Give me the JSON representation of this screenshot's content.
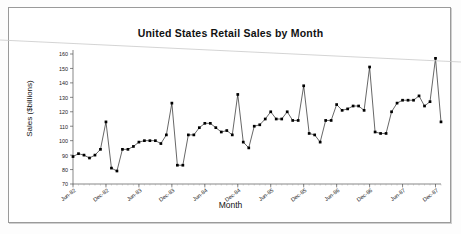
{
  "chart_data": {
    "type": "line",
    "title": "United States Retail Sales by Month",
    "xlabel": "Month",
    "ylabel": "Sales ($billions)",
    "ylim": [
      70,
      160
    ],
    "ytick_step": 10,
    "yticks": [
      70,
      80,
      90,
      100,
      110,
      120,
      130,
      140,
      150,
      160
    ],
    "grid": false,
    "legend": "none",
    "marker": "filled-square",
    "line_color": "#000000",
    "marker_color": "#000000",
    "xticks": [
      "Jun-82",
      "Dec-82",
      "Jun-83",
      "Dec-83",
      "Jun-84",
      "Dec-84",
      "Jun-85",
      "Dec-85",
      "Jun-86",
      "Dec-86",
      "Jun-87",
      "Dec-87"
    ],
    "xtick_indices": [
      0,
      6,
      12,
      18,
      24,
      30,
      36,
      42,
      48,
      54,
      60,
      66
    ],
    "x": [
      "Jun-82",
      "Jul-82",
      "Aug-82",
      "Sep-82",
      "Oct-82",
      "Nov-82",
      "Dec-82",
      "Jan-83",
      "Feb-83",
      "Mar-83",
      "Apr-83",
      "May-83",
      "Jun-83",
      "Jul-83",
      "Aug-83",
      "Sep-83",
      "Oct-83",
      "Nov-83",
      "Dec-83",
      "Jan-84",
      "Feb-84",
      "Mar-84",
      "Apr-84",
      "May-84",
      "Jun-84",
      "Jul-84",
      "Aug-84",
      "Sep-84",
      "Oct-84",
      "Nov-84",
      "Dec-84",
      "Jan-85",
      "Feb-85",
      "Mar-85",
      "Apr-85",
      "May-85",
      "Jun-85",
      "Jul-85",
      "Aug-85",
      "Sep-85",
      "Oct-85",
      "Nov-85",
      "Dec-85",
      "Jan-86",
      "Feb-86",
      "Mar-86",
      "Apr-86",
      "May-86",
      "Jun-86",
      "Jul-86",
      "Aug-86",
      "Sep-86",
      "Oct-86",
      "Nov-86",
      "Dec-86",
      "Jan-87",
      "Feb-87",
      "Mar-87",
      "Apr-87",
      "May-87",
      "Jun-87",
      "Jul-87",
      "Aug-87",
      "Sep-87",
      "Oct-87",
      "Nov-87",
      "Dec-87",
      "Jan-88"
    ],
    "values": [
      89,
      91,
      90,
      88,
      90,
      94,
      113,
      81,
      79,
      94,
      94,
      96,
      99,
      100,
      100,
      100,
      98,
      104,
      126,
      83,
      83,
      104,
      104,
      109,
      112,
      112,
      109,
      106,
      107,
      104,
      132,
      99,
      95,
      110,
      111,
      115,
      120,
      115,
      115,
      120,
      114,
      114,
      138,
      105,
      104,
      99,
      114,
      114,
      125,
      121,
      122,
      124,
      124,
      121,
      151,
      106,
      105,
      105,
      120,
      126,
      128,
      128,
      128,
      131,
      124,
      127,
      157,
      113
    ],
    "series_note": "Monthly US retail sales, $billions, Jun-82 through Jan-88"
  },
  "page": {
    "artifact": "diagonal-scan-line"
  }
}
